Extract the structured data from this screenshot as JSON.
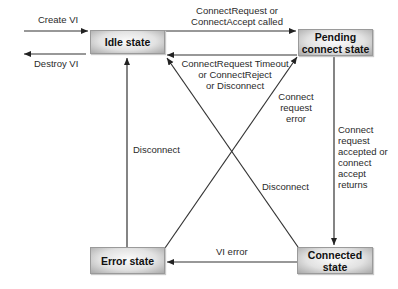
{
  "diagram": {
    "type": "state-machine",
    "states": [
      {
        "id": "idle",
        "label": "Idle state"
      },
      {
        "id": "pending",
        "label": "Pending connect state"
      },
      {
        "id": "error",
        "label": "Error state"
      },
      {
        "id": "connected",
        "label": "Connected state"
      }
    ],
    "boxes": {
      "idle": "Idle state",
      "pending_line1": "Pending",
      "pending_line2": "connect state",
      "error": "Error state",
      "connected_line1": "Connected",
      "connected_line2": "state"
    },
    "transitions": {
      "create_vi": "Create VI",
      "destroy_vi": "Destroy VI",
      "idle_to_pending_1": "ConnectRequest or",
      "idle_to_pending_2": "ConnectAccept called",
      "pending_to_idle_1": "ConnectRequest Timeout",
      "pending_to_idle_2": "or ConnectReject",
      "pending_to_idle_3": "or Disconnect",
      "error_to_pending_1": "Connect",
      "error_to_pending_2": "request",
      "error_to_pending_3": "error",
      "pending_to_connected_1": "Connect",
      "pending_to_connected_2": "request",
      "pending_to_connected_3": "accepted or",
      "pending_to_connected_4": "connect",
      "pending_to_connected_5": "accept",
      "pending_to_connected_6": "returns",
      "error_to_idle": "Disconnect",
      "connected_to_idle": "Disconnect",
      "connected_to_error": "VI error"
    },
    "edges": [
      {
        "from": "external",
        "to": "idle",
        "label": "Create VI"
      },
      {
        "from": "idle",
        "to": "external",
        "label": "Destroy VI"
      },
      {
        "from": "idle",
        "to": "pending",
        "label": "ConnectRequest or ConnectAccept called"
      },
      {
        "from": "pending",
        "to": "idle",
        "label": "ConnectRequest Timeout or ConnectReject or Disconnect"
      },
      {
        "from": "error",
        "to": "pending",
        "label": "Connect request error"
      },
      {
        "from": "pending",
        "to": "connected",
        "label": "Connect request accepted or connect accept returns"
      },
      {
        "from": "error",
        "to": "idle",
        "label": "Disconnect"
      },
      {
        "from": "connected",
        "to": "idle",
        "label": "Disconnect"
      },
      {
        "from": "connected",
        "to": "error",
        "label": "VI error"
      }
    ]
  }
}
